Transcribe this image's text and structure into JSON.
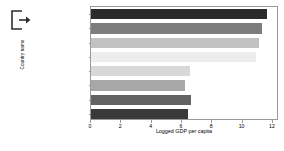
{
  "icon": {
    "name": "export-arrow-icon",
    "label": "export"
  },
  "chart_data": {
    "type": "bar",
    "orientation": "horizontal",
    "title": "",
    "xlabel": "Logged GDP per capita",
    "ylabel": "Country name",
    "categories": [
      "Luxembourg",
      "Singapore",
      "Ireland",
      "Switzerland",
      "Mozambique",
      "Niger",
      "Malawi",
      "Burundi"
    ],
    "values": [
      11.6,
      11.3,
      11.1,
      10.9,
      6.5,
      6.2,
      6.6,
      6.4
    ],
    "bar_colors": [
      "#2b2b2b",
      "#7d7d7d",
      "#c2c2c2",
      "#ededed",
      "#d8d8d8",
      "#a8a8a8",
      "#636363",
      "#3a3a3a"
    ],
    "xticks": [
      0,
      2,
      4,
      6,
      8,
      10,
      12
    ],
    "xtick_labels": [
      "0",
      "2",
      "4",
      "6",
      "8",
      "10",
      "12"
    ],
    "xlim": [
      0,
      12.4
    ],
    "grid": false,
    "legend": false
  }
}
